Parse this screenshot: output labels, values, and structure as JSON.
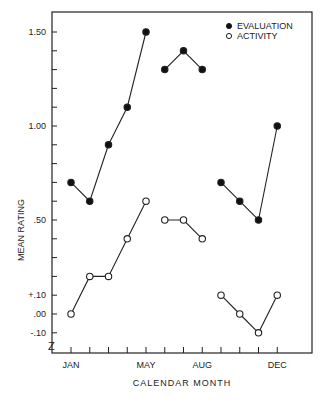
{
  "chart_data": {
    "type": "line",
    "title": "",
    "xlabel": "CALENDAR MONTH",
    "ylabel": "MEAN RATING",
    "categories": [
      "JAN",
      "FEB",
      "MAR",
      "APR",
      "MAY",
      "JUN",
      "JUL",
      "AUG",
      "SEP",
      "OCT",
      "NOV",
      "DEC"
    ],
    "x_tick_labels": [
      {
        "index": 0,
        "label": "JAN"
      },
      {
        "index": 4,
        "label": "MAY"
      },
      {
        "index": 7,
        "label": "AUG"
      },
      {
        "index": 11,
        "label": "DEC"
      }
    ],
    "y_tick_labels": [
      {
        "value": 1.5,
        "label": "1.50"
      },
      {
        "value": 1.0,
        "label": "1.00"
      },
      {
        "value": 0.5,
        "label": ".50"
      },
      {
        "value": 0.1,
        "label": "+.10"
      },
      {
        "value": 0.0,
        "label": ".00"
      },
      {
        "value": -0.1,
        "label": "-.10"
      }
    ],
    "ylim": [
      -0.15,
      1.6
    ],
    "axis_break": true,
    "grid": false,
    "legend_position": "top-right",
    "segments": [
      [
        0,
        4
      ],
      [
        5,
        7
      ],
      [
        8,
        11
      ]
    ],
    "series": [
      {
        "name": "EVALUATION",
        "marker": "filled-circle",
        "values": [
          0.7,
          0.6,
          0.9,
          1.1,
          1.5,
          1.3,
          1.4,
          1.3,
          0.7,
          0.6,
          0.5,
          1.0
        ]
      },
      {
        "name": "ACTIVITY",
        "marker": "open-circle",
        "values": [
          0.0,
          0.2,
          0.2,
          0.4,
          0.6,
          0.5,
          0.5,
          0.4,
          0.1,
          0.0,
          -0.1,
          0.1
        ]
      }
    ]
  }
}
